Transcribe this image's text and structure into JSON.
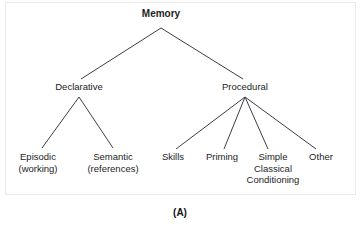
{
  "figure": {
    "caption": "(A)",
    "frame_color": "#e9e9ec",
    "line_color": "#3c3c46",
    "text_color": "#1d1d1d",
    "background": "#ffffff"
  },
  "tree": {
    "root": {
      "label": "Memory",
      "x": 161,
      "y": 14
    },
    "level1": [
      {
        "label": "Declarative",
        "x": 79,
        "y": 87
      },
      {
        "label": "Procedural",
        "x": 245,
        "y": 87
      }
    ],
    "leaves": [
      {
        "lines": [
          "Episodic",
          "(working)"
        ],
        "x": 38,
        "y": 157,
        "parent": "Declarative"
      },
      {
        "lines": [
          "Semantic",
          "(references)"
        ],
        "x": 113,
        "y": 157,
        "parent": "Declarative"
      },
      {
        "lines": [
          "Skills"
        ],
        "x": 173,
        "y": 157,
        "parent": "Procedural"
      },
      {
        "lines": [
          "Priming"
        ],
        "x": 222,
        "y": 157,
        "parent": "Procedural"
      },
      {
        "lines": [
          "Simple",
          "Classical",
          "Conditioning"
        ],
        "x": 273,
        "y": 157,
        "parent": "Procedural"
      },
      {
        "lines": [
          "Other"
        ],
        "x": 321,
        "y": 157,
        "parent": "Procedural"
      }
    ],
    "edges": [
      {
        "name": "memory-to-declarative",
        "x1": 161,
        "y1": 28,
        "x2": 81,
        "y2": 79
      },
      {
        "name": "memory-to-procedural",
        "x1": 161,
        "y1": 28,
        "x2": 243,
        "y2": 79
      },
      {
        "name": "declarative-to-episodic",
        "x1": 79,
        "y1": 97,
        "x2": 42,
        "y2": 148
      },
      {
        "name": "declarative-to-semantic",
        "x1": 79,
        "y1": 97,
        "x2": 113,
        "y2": 148
      },
      {
        "name": "procedural-to-skills",
        "x1": 245,
        "y1": 97,
        "x2": 176,
        "y2": 149
      },
      {
        "name": "procedural-to-priming",
        "x1": 245,
        "y1": 97,
        "x2": 224,
        "y2": 149
      },
      {
        "name": "procedural-to-simple-classical-conditioning",
        "x1": 245,
        "y1": 97,
        "x2": 268,
        "y2": 149
      },
      {
        "name": "procedural-to-other",
        "x1": 245,
        "y1": 97,
        "x2": 316,
        "y2": 149
      }
    ]
  }
}
